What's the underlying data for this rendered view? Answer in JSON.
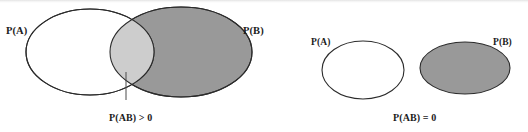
{
  "figure": {
    "width": 528,
    "height": 132,
    "background": "#ffffff"
  },
  "colors": {
    "stroke": "#2b2b2b",
    "fill_b": "#999999",
    "fill_intersection": "#cdcdcd",
    "fill_a": "#ffffff",
    "text": "#1c1c1c"
  },
  "diagrams": [
    {
      "id": "overlapping",
      "name": "overlapping-events",
      "caption": "P(AB) > 0",
      "labels": {
        "a": "P(A)",
        "b": "P(B)"
      },
      "ellipse_a": {
        "cx": 90,
        "cy": 52,
        "rx": 64,
        "ry": 43,
        "fill": "#ffffff"
      },
      "ellipse_b": {
        "cx": 181,
        "cy": 52,
        "rx": 71,
        "ry": 45,
        "fill": "#999999"
      },
      "intersection_fill": "#cdcdcd",
      "leader_line": {
        "x": 126,
        "y1": 72,
        "y2": 100
      }
    },
    {
      "id": "disjoint",
      "name": "disjoint-events",
      "caption": "P(AB) = 0",
      "labels": {
        "a": "P(A)",
        "b": "P(B)"
      },
      "ellipse_a": {
        "cx": 363,
        "cy": 70,
        "rx": 41,
        "ry": 29,
        "fill": "#ffffff"
      },
      "ellipse_b": {
        "cx": 465,
        "cy": 68,
        "rx": 45,
        "ry": 26,
        "fill": "#999999"
      },
      "intersection_fill": "none",
      "leader_line": null
    }
  ]
}
